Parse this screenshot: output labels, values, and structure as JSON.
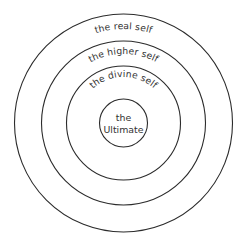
{
  "diagram": {
    "type": "concentric-circles",
    "title": "",
    "background_color": "#ffffff",
    "stroke_color": "#2b2b2b",
    "text_color": "#333333",
    "center": {
      "x": 123.5,
      "y": 123
    },
    "rings": [
      {
        "id": "ring-outer",
        "label": "the real self",
        "radius": 109,
        "label_curved": true,
        "level": 1
      },
      {
        "id": "ring-second",
        "label": "the higher self",
        "radius": 82,
        "label_curved": true,
        "level": 2
      },
      {
        "id": "ring-third",
        "label": "the divine self",
        "radius": 57,
        "label_curved": true,
        "level": 3
      },
      {
        "id": "ring-core",
        "label": "the Ultimate",
        "label_line_1": "the",
        "label_line_2": "Ultimate",
        "radius": 24,
        "label_curved": false,
        "level": 4
      }
    ]
  }
}
